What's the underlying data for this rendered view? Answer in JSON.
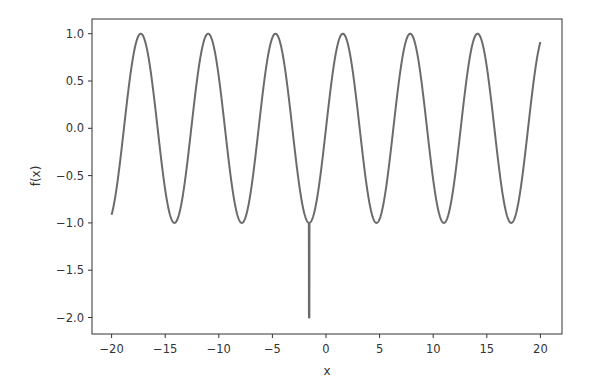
{
  "chart_data": {
    "type": "line",
    "title": "",
    "xlabel": "x",
    "ylabel": "f(x)",
    "xlim": [
      -22,
      22
    ],
    "ylim": [
      -2.15,
      1.15
    ],
    "xticks": [
      -20,
      -15,
      -10,
      -5,
      0,
      5,
      10,
      15,
      20
    ],
    "xtick_labels": [
      "−20",
      "−15",
      "−10",
      "−5",
      "0",
      "5",
      "10",
      "15",
      "20"
    ],
    "yticks": [
      1.0,
      0.5,
      0.0,
      -0.5,
      -1.0,
      -1.5,
      -2.0
    ],
    "ytick_labels": [
      "1.0",
      "0.5",
      "0.0",
      "−0.5",
      "−1.0",
      "−1.5",
      "−2.0"
    ],
    "grid": false,
    "legend": null,
    "series": [
      {
        "name": "f(x)",
        "description": "sin(x) on [-20, 20] with a narrow downward spike to -2.0 at x ≈ -1.57",
        "function": "sin",
        "x_range": [
          -20,
          20
        ],
        "spike": {
          "x": -1.5708,
          "from": -1.0,
          "to": -2.0
        },
        "color": "#6b6b6b",
        "sample_points": [
          [
            -20,
            -0.913
          ],
          [
            -17.28,
            1.0
          ],
          [
            -14.14,
            -1.0
          ],
          [
            -10.99,
            1.0
          ],
          [
            -7.85,
            -1.0
          ],
          [
            -4.71,
            1.0
          ],
          [
            -1.57,
            -1.0
          ],
          [
            -1.57,
            -2.0
          ],
          [
            -1.57,
            -1.0
          ],
          [
            1.57,
            1.0
          ],
          [
            4.71,
            -1.0
          ],
          [
            7.85,
            1.0
          ],
          [
            10.99,
            -1.0
          ],
          [
            14.14,
            1.0
          ],
          [
            17.28,
            -1.0
          ],
          [
            20,
            0.913
          ]
        ]
      }
    ]
  }
}
